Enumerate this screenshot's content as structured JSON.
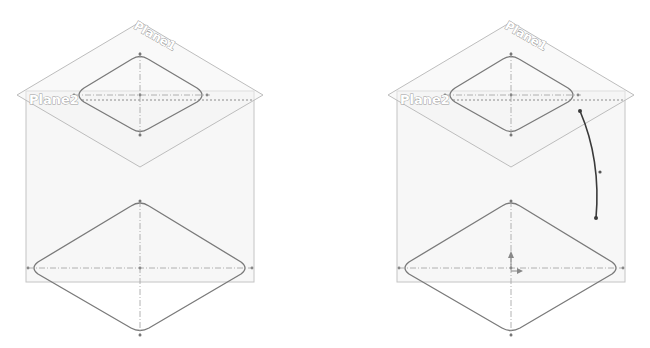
{
  "figure": {
    "views": [
      {
        "id": "left",
        "offset_x": 0,
        "plane1_label": "Plane1",
        "plane2_label": "Plane2",
        "has_path": false,
        "has_origin": false
      },
      {
        "id": "right",
        "offset_x": 371,
        "plane1_label": "Plane1",
        "plane2_label": "Plane2",
        "has_path": true,
        "has_origin": true
      }
    ],
    "colors": {
      "plane_edge": "#c2c2c2",
      "plane_fill": "#f6f6f6",
      "sketch": "#7a7a7a",
      "centerline": "#9c9c9c",
      "path": "#3a3a3a",
      "label": "#9a9a9a"
    }
  }
}
